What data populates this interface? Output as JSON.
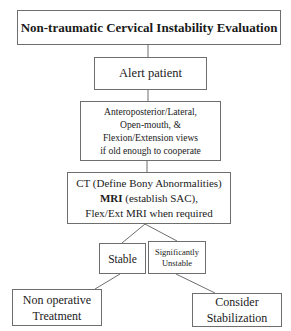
{
  "flowchart": {
    "title": "Non-traumatic Cervical Instability Evaluation",
    "alert": "Alert patient",
    "views": {
      "lines": [
        "Anteroposterior/Lateral,",
        "Open-mouth, &",
        "Flexion/Extension views",
        "if old enough to cooperate"
      ]
    },
    "imaging": {
      "line1": "CT (Define Bony Abnormalities)",
      "line2_bold": "MRI",
      "line2_rest": " (establish SAC),",
      "line3": "Flex/Ext MRI when required"
    },
    "stable": "Stable",
    "unstable": {
      "lines": [
        "Significantly",
        "Unstable"
      ]
    },
    "non_operative": {
      "lines": [
        "Non operative",
        "Treatment"
      ]
    },
    "consider": {
      "lines": [
        "Consider",
        "Stabilization"
      ]
    }
  },
  "colors": {
    "border": "#6e6e6e",
    "text": "#1a1a1a",
    "background": "#ffffff"
  }
}
